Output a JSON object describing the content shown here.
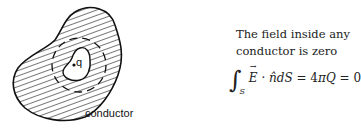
{
  "diagram": {
    "conductor_label": "conductor",
    "charge_label": "q",
    "colors": {
      "stroke": "#111111",
      "hatch": "#555555",
      "background": "#ffffff"
    }
  },
  "text": {
    "line1": "The field inside any",
    "line2": "conductor is zero"
  },
  "equation": {
    "integral": "∫",
    "subscript": "S",
    "E": "E",
    "dot": " · ",
    "nhat": "n̂",
    "dS": "dS",
    "eq1": " = 4",
    "pi": "π",
    "Q": "Q",
    "eq2": " = 0"
  }
}
